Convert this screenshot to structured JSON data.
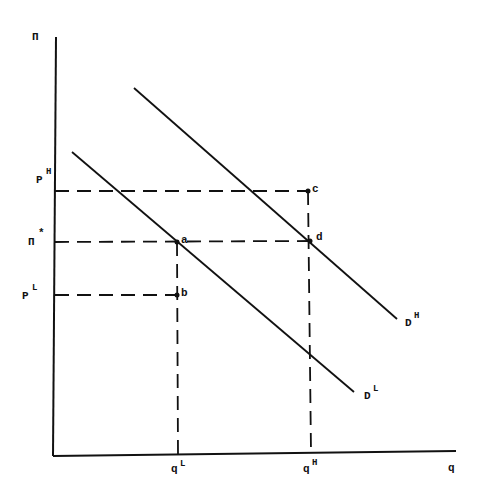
{
  "diagram": {
    "axes": {
      "y_label": "Π",
      "x_label": "q"
    },
    "price_labels": {
      "p_high": "P",
      "p_high_sup": "H",
      "pi_star": "Π",
      "pi_star_sup": "*",
      "p_low": "P",
      "p_low_sup": "L"
    },
    "quantity_labels": {
      "q_low": "q",
      "q_low_sup": "L",
      "q_high": "q",
      "q_high_sup": "H"
    },
    "curves": {
      "demand_high": "D",
      "demand_high_sup": "H",
      "demand_low": "D",
      "demand_low_sup": "L"
    },
    "points": {
      "a": "a",
      "b": "b",
      "c": "c",
      "d": "d"
    },
    "colors": {
      "ink": "#111111",
      "background": "#ffffff"
    }
  }
}
